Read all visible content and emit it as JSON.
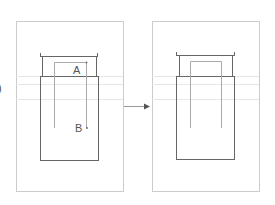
{
  "diagram": {
    "type": "before-after schematic",
    "panels": [
      {
        "id": "before",
        "labels": [
          {
            "text": "A",
            "description": "start point of inner path"
          },
          {
            "text": "B",
            "description": "end point of inner path"
          }
        ],
        "has_inner_path": true
      },
      {
        "id": "after",
        "labels": [],
        "has_inner_path": true
      }
    ],
    "arrow": {
      "direction": "right",
      "meaning": "transformation"
    },
    "left_margin_mark": ")"
  },
  "colors": {
    "frame": "#c8c8c8",
    "shape": "#666666",
    "inner_path": "#b0b0b0",
    "guide_lines": "#e4e4e4",
    "arrow": "#555555",
    "text": "#555555"
  }
}
